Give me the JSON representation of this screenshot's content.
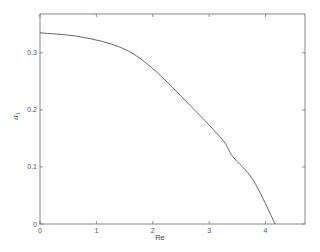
{
  "chart_data": {
    "type": "line",
    "title": "",
    "xlabel": "Re",
    "ylabel": "a1",
    "xlim": [
      0,
      4.7
    ],
    "ylim": [
      0,
      0.368
    ],
    "xticks": [
      0,
      1,
      2,
      3,
      4
    ],
    "xtick_labels": [
      "0",
      "1",
      "2",
      "3",
      "4"
    ],
    "yticks": [
      0,
      0.1,
      0.2,
      0.3
    ],
    "ytick_labels": [
      "0",
      "0.1",
      "0.2",
      "0.3"
    ],
    "grid": false,
    "legend": null,
    "series": [
      {
        "name": "a1",
        "x": [
          0,
          0.72,
          1.44,
          1.98,
          2.7,
          3.24,
          3.42,
          3.78,
          4.17
        ],
        "y": [
          0.335,
          0.328,
          0.309,
          0.274,
          0.204,
          0.147,
          0.118,
          0.077,
          0.0
        ]
      }
    ]
  },
  "colors": {
    "line": "#555555",
    "frame": "#666666"
  }
}
